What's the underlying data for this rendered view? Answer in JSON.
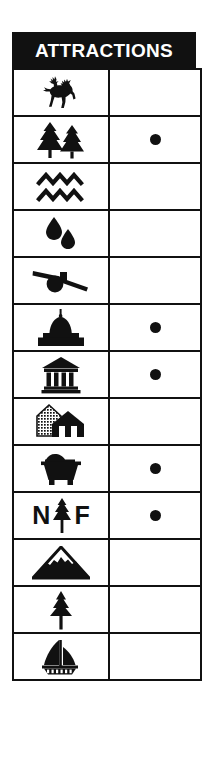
{
  "legend": {
    "title": "ATTRACTIONS",
    "columns": [
      "symbol",
      "marker"
    ],
    "rows": [
      {
        "icon": "deer-icon",
        "label": "Wildlife Viewing",
        "marker": false,
        "marker_symbol": ""
      },
      {
        "icon": "pine-trees-icon",
        "label": "Forest / Campground",
        "marker": true,
        "marker_symbol": "●"
      },
      {
        "icon": "water-waves-icon",
        "label": "Waterway",
        "marker": false,
        "marker_symbol": ""
      },
      {
        "icon": "water-drops-icon",
        "label": "Spring",
        "marker": false,
        "marker_symbol": ""
      },
      {
        "icon": "cannon-icon",
        "label": "Battlefield",
        "marker": false,
        "marker_symbol": ""
      },
      {
        "icon": "capitol-dome-icon",
        "label": "State Capitol",
        "marker": true,
        "marker_symbol": "●"
      },
      {
        "icon": "museum-icon",
        "label": "Museum",
        "marker": true,
        "marker_symbol": "●"
      },
      {
        "icon": "historic-houses-icon",
        "label": "Historic Houses",
        "marker": false,
        "marker_symbol": ""
      },
      {
        "icon": "mine-cart-icon",
        "label": "Mine",
        "marker": true,
        "marker_symbol": "●"
      },
      {
        "icon": "national-forest-icon",
        "label": "N F",
        "marker": true,
        "marker_symbol": "●"
      },
      {
        "icon": "mountain-icon",
        "label": "Mountain Peak",
        "marker": false,
        "marker_symbol": ""
      },
      {
        "icon": "single-tree-icon",
        "label": "Tree",
        "marker": false,
        "marker_symbol": ""
      },
      {
        "icon": "sailboat-icon",
        "label": "Boating",
        "marker": false,
        "marker_symbol": ""
      }
    ],
    "national_forest": {
      "left_letter": "N",
      "right_letter": "F"
    },
    "colors": {
      "ink": "#111111",
      "paper": "#ffffff",
      "header_text": "#ffffff"
    }
  }
}
